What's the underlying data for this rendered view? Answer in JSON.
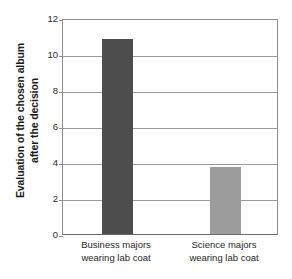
{
  "chart_data": {
    "type": "bar",
    "title": "",
    "subtitle": "",
    "xlabel": "",
    "ylabel": "Evaluation of the chosen album after the decision",
    "ylabel_lines": [
      "Evaluation of the chosen album",
      "after the decision"
    ],
    "categories": [
      "Business majors wearing lab coat",
      "Science majors wearing lab coat"
    ],
    "category_lines": [
      [
        "Business majors",
        "wearing lab coat"
      ],
      [
        "Science majors",
        "wearing lab coat"
      ]
    ],
    "values": [
      10.85,
      3.75
    ],
    "ylim": [
      0,
      12
    ],
    "ytick_labels": [
      "0",
      "2",
      "4",
      "6",
      "8",
      "10",
      "12"
    ],
    "ytick_values": [
      0,
      2,
      4,
      6,
      8,
      10,
      12
    ],
    "grid": "horizontal",
    "legend": "none",
    "bar_colors": [
      "#4d4d4d",
      "#9c9c9c"
    ],
    "axis_color": "#8d8d8d",
    "gridline_color": "#9a9a9a",
    "background_color": "#ffffff"
  }
}
